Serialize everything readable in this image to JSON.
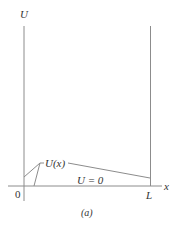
{
  "figure": {
    "caption": "(a)",
    "y_axis_label": "U",
    "x_axis_label": "x",
    "origin_label": "0",
    "right_wall_label": "L",
    "potential_label": "U(x)",
    "zero_region_label": "U = 0",
    "colors": {
      "line": "#8c8c8c",
      "text": "#333333",
      "background": "#ffffff"
    }
  }
}
